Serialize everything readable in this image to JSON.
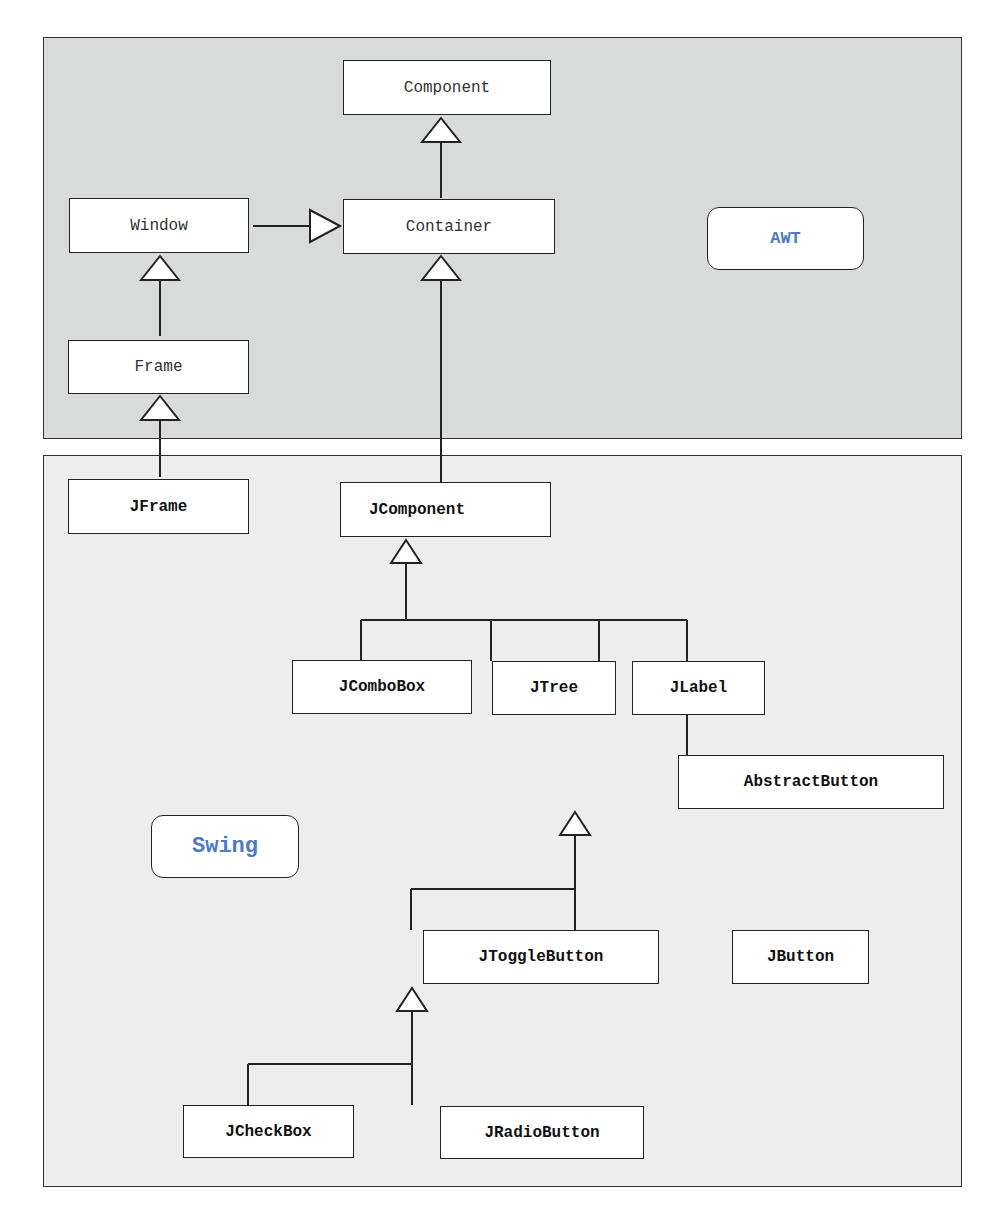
{
  "regions": {
    "awt": {
      "label": "AWT",
      "background": "#d9dbdb"
    },
    "swing": {
      "label": "Swing",
      "background": "#ecedec"
    }
  },
  "label_color": "#4a7ac8",
  "classes": {
    "component": "Component",
    "container": "Container",
    "window": "Window",
    "frame": "Frame",
    "jframe": "JFrame",
    "jcomponent": "JComponent",
    "jcombobox": "JComboBox",
    "jtree": "JTree",
    "jlabel": "JLabel",
    "abstractbutton": "AbstractButton",
    "jtogglebutton": "JToggleButton",
    "jbutton": "JButton",
    "jcheckbox": "JCheckBox",
    "jradiobutton": "JRadioButton"
  },
  "relationships": [
    {
      "child": "Container",
      "parent": "Component"
    },
    {
      "child": "Window",
      "parent": "Container"
    },
    {
      "child": "Frame",
      "parent": "Window"
    },
    {
      "child": "JFrame",
      "parent": "Frame"
    },
    {
      "child": "JComponent",
      "parent": "Container"
    },
    {
      "child": "JComboBox",
      "parent": "JComponent"
    },
    {
      "child": "JTree",
      "parent": "JComponent"
    },
    {
      "child": "JLabel",
      "parent": "JComponent"
    },
    {
      "child": "AbstractButton",
      "parent": "JComponent"
    },
    {
      "child": "JToggleButton",
      "parent": "AbstractButton"
    },
    {
      "child": "JButton",
      "parent": "AbstractButton"
    },
    {
      "child": "JCheckBox",
      "parent": "JToggleButton"
    },
    {
      "child": "JRadioButton",
      "parent": "JToggleButton"
    }
  ]
}
